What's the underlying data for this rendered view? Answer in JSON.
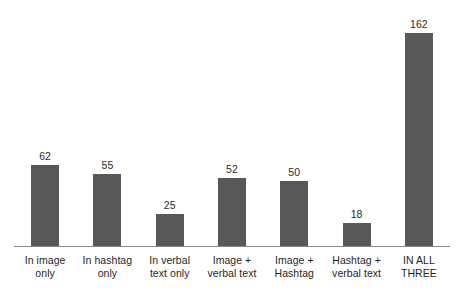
{
  "chart_data": {
    "type": "bar",
    "title": "",
    "subtitle": "",
    "xlabel": "",
    "ylabel": "",
    "ylim": [
      0,
      162
    ],
    "grid": false,
    "legend": "none",
    "axis": {
      "baseline_visible": true,
      "y_axis_visible": false,
      "tick_labels_visible": false
    },
    "bar_color": "#585858",
    "axis_color": "#8a8a8a",
    "value_label_color": "#2b2b2b",
    "category_label_color": "#1f1f1f",
    "categories": [
      "In image only",
      "In hashtag only",
      "In verbal text only",
      "Image + verbal text",
      "Image + Hashtag",
      "Hashtag + verbal text",
      "IN ALL THREE"
    ],
    "values": [
      62,
      55,
      25,
      52,
      50,
      18,
      162
    ],
    "bars": [
      {
        "value": 62,
        "value_label": "62",
        "category": "In image only",
        "label_lines": [
          "In image",
          "only"
        ]
      },
      {
        "value": 55,
        "value_label": "55",
        "category": "In hashtag only",
        "label_lines": [
          "In hashtag",
          "only"
        ]
      },
      {
        "value": 25,
        "value_label": "25",
        "category": "In verbal text only",
        "label_lines": [
          "In verbal",
          "text only"
        ]
      },
      {
        "value": 52,
        "value_label": "52",
        "category": "Image + verbal text",
        "label_lines": [
          "Image +",
          "verbal text"
        ]
      },
      {
        "value": 50,
        "value_label": "50",
        "category": "Image + Hashtag",
        "label_lines": [
          "Image +",
          "Hashtag"
        ]
      },
      {
        "value": 18,
        "value_label": "18",
        "category": "Hashtag + verbal text",
        "label_lines": [
          "Hashtag +",
          "verbal text"
        ]
      },
      {
        "value": 162,
        "value_label": "162",
        "category": "IN ALL THREE",
        "label_lines": [
          "IN ALL",
          "THREE"
        ]
      }
    ]
  }
}
